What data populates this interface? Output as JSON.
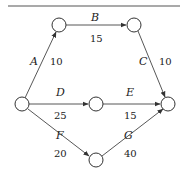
{
  "diagram": {
    "type": "activity-network",
    "nodes": [
      {
        "id": "n1",
        "x": 22,
        "y": 104
      },
      {
        "id": "n2",
        "x": 59,
        "y": 25
      },
      {
        "id": "n3",
        "x": 134,
        "y": 25
      },
      {
        "id": "n4",
        "x": 96,
        "y": 104
      },
      {
        "id": "n5",
        "x": 168,
        "y": 104
      },
      {
        "id": "n6",
        "x": 96,
        "y": 160
      }
    ],
    "edges": [
      {
        "from": "n1",
        "to": "n2",
        "label": "A",
        "weight": "10"
      },
      {
        "from": "n2",
        "to": "n3",
        "label": "B",
        "weight": "15"
      },
      {
        "from": "n3",
        "to": "n5",
        "label": "C",
        "weight": "10"
      },
      {
        "from": "n1",
        "to": "n4",
        "label": "D",
        "weight": "25"
      },
      {
        "from": "n4",
        "to": "n5",
        "label": "E",
        "weight": "15"
      },
      {
        "from": "n1",
        "to": "n6",
        "label": "F",
        "weight": "20"
      },
      {
        "from": "n6",
        "to": "n5",
        "label": "G",
        "weight": "40"
      }
    ],
    "labels": {
      "A": "A",
      "B": "B",
      "C": "C",
      "D": "D",
      "E": "E",
      "F": "F",
      "G": "G",
      "wA": "10",
      "wB": "15",
      "wC": "10",
      "wD": "25",
      "wE": "15",
      "wF": "20",
      "wG": "40"
    }
  }
}
